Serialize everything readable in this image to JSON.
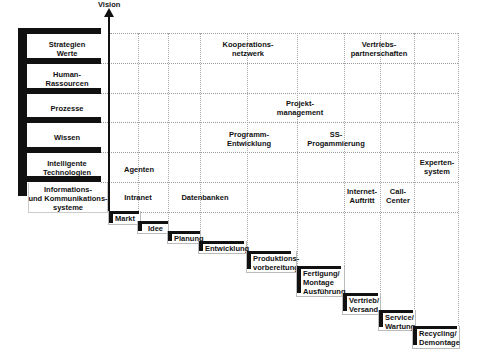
{
  "axis": {
    "label": "Vision"
  },
  "rows": [
    {
      "label": "Strategien\nWerte",
      "line1": "Strategien",
      "line2": "Werte"
    },
    {
      "label": "Human-\nRassourcen",
      "line1": "Human-",
      "line2": "Rassourcen"
    },
    {
      "label": "Prozesse",
      "line1": "Prozesse",
      "line2": ""
    },
    {
      "label": "Wissen",
      "line1": "Wissen",
      "line2": ""
    },
    {
      "label": "Intelligente\nTechnologien",
      "line1": "Intelligente",
      "line2": "Technologien"
    },
    {
      "label": "Informations- und Kommunikationssysteme",
      "line1": "Informations-",
      "line2": "und Kommunikations-",
      "line3": "systeme"
    }
  ],
  "cells": [
    {
      "row": 0,
      "line1": "Kooperations-",
      "line2": "netzwerk"
    },
    {
      "row": 0,
      "line1": "Vertriebs-",
      "line2": "partnerschaften"
    },
    {
      "row": 2,
      "line1": "Projekt-",
      "line2": "management"
    },
    {
      "row": 3,
      "line1": "Programm-",
      "line2": "Entwicklung"
    },
    {
      "row": 3,
      "line1": "SS-",
      "line2": "Progammierung"
    },
    {
      "row": 4,
      "line1": "Agenten",
      "line2": ""
    },
    {
      "row": 4,
      "line1": "Experten-",
      "line2": "system"
    },
    {
      "row": 5,
      "line1": "Intranet",
      "line2": ""
    },
    {
      "row": 5,
      "line1": "Datenbanken",
      "line2": ""
    },
    {
      "row": 5,
      "line1": "Internet-",
      "line2": "Auftritt"
    },
    {
      "row": 5,
      "line1": "Call-",
      "line2": "Center"
    }
  ],
  "steps": [
    {
      "line1": "Markt"
    },
    {
      "line1": "Idee"
    },
    {
      "line1": "Planung"
    },
    {
      "line1": "Entwicklung"
    },
    {
      "line1": "Produktions-",
      "line2": "vorbereitung"
    },
    {
      "line1": "Fertigung/",
      "line2": "Montage",
      "line3": "Ausführung"
    },
    {
      "line1": "Vertrieb/",
      "line2": "Versand"
    },
    {
      "line1": "Service/",
      "line2": "Wartung"
    },
    {
      "line1": "Recycling/",
      "line2": "Demontage"
    }
  ]
}
